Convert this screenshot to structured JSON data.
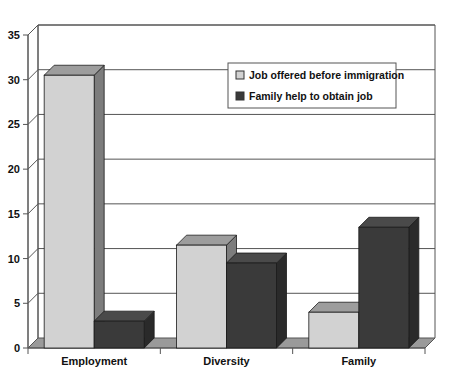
{
  "chart_data": {
    "type": "bar",
    "title": "",
    "subtitle": "",
    "xlabel": "",
    "ylabel": "",
    "categories": [
      "Employment",
      "Diversity",
      "Family"
    ],
    "series": [
      {
        "name": "Job offered before immigration",
        "values": [
          30.5,
          11.5,
          4.0
        ],
        "color": "#d2d2d2"
      },
      {
        "name": "Family help to obtain job",
        "values": [
          3.0,
          9.5,
          13.5
        ],
        "color": "#3a3a3a"
      }
    ],
    "ylim": [
      0,
      35
    ],
    "ytick_labels": [
      "0",
      "5",
      "10",
      "15",
      "20",
      "25",
      "30",
      "35"
    ],
    "ytick_values": [
      0,
      5,
      10,
      15,
      20,
      25,
      30,
      35
    ],
    "grid": true,
    "grid_axis": "y",
    "legend_position": "upper-center",
    "style": "3d-column",
    "axis_color": "#555555",
    "grid_color": "#555555",
    "plot_background": "#ffffff",
    "floor_color": "#9a9a9a"
  },
  "legend": {
    "items": [
      {
        "label": "Job offered before immigration",
        "swatch": "#d2d2d2"
      },
      {
        "label": "Family help to obtain job",
        "swatch": "#3a3a3a"
      }
    ],
    "border_color": "#555555",
    "background": "#ffffff"
  },
  "axes": {
    "y": {
      "ticks": [
        "35",
        "30",
        "25",
        "20",
        "15",
        "10",
        "5",
        "0"
      ]
    },
    "x": {
      "ticks": [
        "Employment",
        "Diversity",
        "Family"
      ]
    }
  }
}
